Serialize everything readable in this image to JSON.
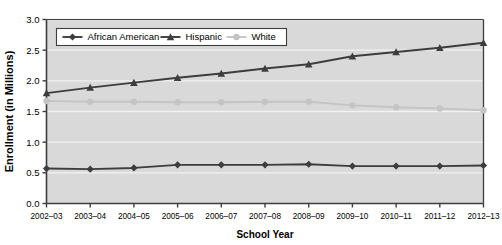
{
  "chart_data": {
    "type": "line",
    "title": "",
    "xlabel": "School Year",
    "ylabel": "Enrollment (in Millions)",
    "categories": [
      "2002–03",
      "2003–04",
      "2004–05",
      "2005–06",
      "2006–07",
      "2007–08",
      "2008–09",
      "2009–10",
      "2010–11",
      "2011–12",
      "2012–13"
    ],
    "ylim": [
      0.0,
      3.0
    ],
    "ytick_labels": [
      "0.0",
      "0.5",
      "1.0",
      "1.5",
      "2.0",
      "2.5",
      "3.0"
    ],
    "ytick_values": [
      0.0,
      0.5,
      1.0,
      1.5,
      2.0,
      2.5,
      3.0
    ],
    "grid": true,
    "grid_axis": "y",
    "legend_position": "top-left-inside",
    "series": [
      {
        "name": "African American",
        "marker": "diamond",
        "color": "#3d3d3d",
        "values": [
          0.57,
          0.56,
          0.58,
          0.63,
          0.63,
          0.63,
          0.64,
          0.61,
          0.61,
          0.61,
          0.62
        ]
      },
      {
        "name": "Hispanic",
        "marker": "triangle",
        "color": "#3d3d3d",
        "values": [
          1.8,
          1.89,
          1.97,
          2.05,
          2.12,
          2.2,
          2.27,
          2.4,
          2.47,
          2.54,
          2.62
        ]
      },
      {
        "name": "White",
        "marker": "circle",
        "color": "#c4c4c4",
        "values": [
          1.67,
          1.66,
          1.66,
          1.65,
          1.65,
          1.66,
          1.66,
          1.6,
          1.57,
          1.55,
          1.52
        ]
      }
    ]
  },
  "style": {
    "plot_background": "#d9d9d9",
    "grid_color": "#f2f2f2",
    "axis_color": "#3d3d3d",
    "legend_background": "#ffffff",
    "legend_border": "#3d3d3d"
  }
}
